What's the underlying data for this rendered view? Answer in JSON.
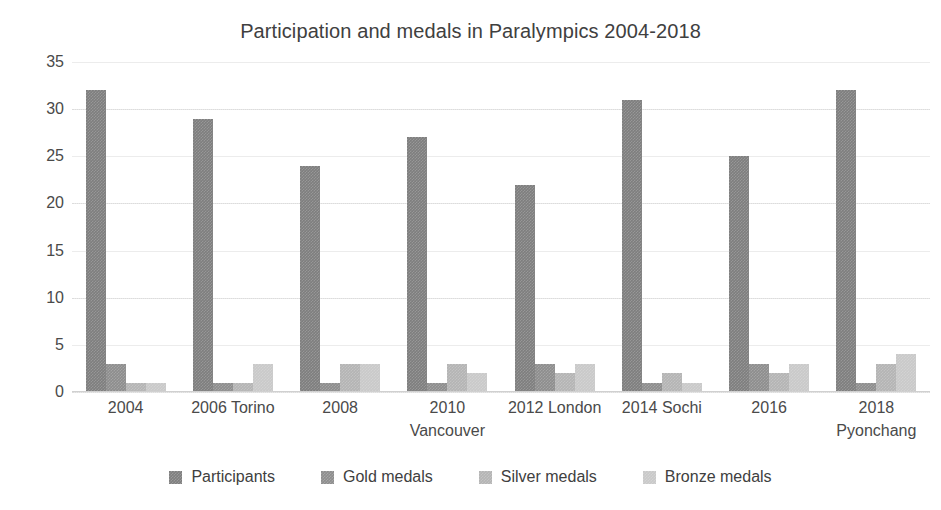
{
  "chart_data": {
    "type": "bar",
    "title": "Participation and medals in Paralympics 2004-2018",
    "xlabel": "",
    "ylabel": "",
    "ylim": [
      0,
      35
    ],
    "yticks": [
      0,
      5,
      10,
      15,
      20,
      25,
      30,
      35
    ],
    "grid": true,
    "legend_position": "bottom",
    "categories": [
      "2004",
      "2006 Torino",
      "2008",
      "2010 Vancouver",
      "2012 London",
      "2014 Sochi",
      "2016",
      "2018 Pyonchang"
    ],
    "category_lines": [
      [
        "2004",
        ""
      ],
      [
        "2006 Torino",
        ""
      ],
      [
        "2008",
        ""
      ],
      [
        "2010",
        "Vancouver"
      ],
      [
        "2012 London",
        ""
      ],
      [
        "2014 Sochi",
        ""
      ],
      [
        "2016",
        ""
      ],
      [
        "2018",
        "Pyonchang"
      ]
    ],
    "series": [
      {
        "name": "Participants",
        "color": "#7e7e7e",
        "values": [
          32,
          29,
          24,
          27,
          22,
          31,
          25,
          32
        ]
      },
      {
        "name": "Gold medals",
        "color": "#8d8d8d",
        "values": [
          3,
          1,
          1,
          1,
          3,
          1,
          3,
          1
        ]
      },
      {
        "name": "Silver medals",
        "color": "#b4b4b4",
        "values": [
          1,
          1,
          3,
          3,
          2,
          2,
          2,
          3
        ]
      },
      {
        "name": "Bronze medals",
        "color": "#c9c9c9",
        "values": [
          1,
          3,
          3,
          2,
          3,
          1,
          3,
          4
        ]
      }
    ]
  },
  "colors": {
    "background": "#ffffff",
    "text": "#404040",
    "gridline": "#e8e8e8",
    "axis": "#d0d0d0"
  }
}
